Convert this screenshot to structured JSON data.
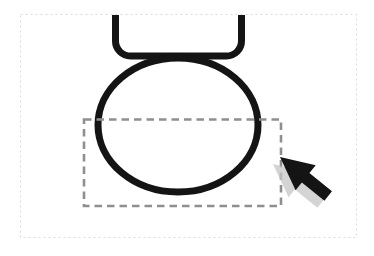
{
  "figure": {
    "icons": {
      "cursor": "arrow-pointer-icon"
    },
    "colors": {
      "background": "#ffffff",
      "frame_border": "#dcdcdc",
      "shape_stroke": "#141414",
      "marquee_stroke": "#8f8f8f",
      "cursor_fill": "#141414",
      "cursor_shadow": "#c5c5c5"
    }
  }
}
